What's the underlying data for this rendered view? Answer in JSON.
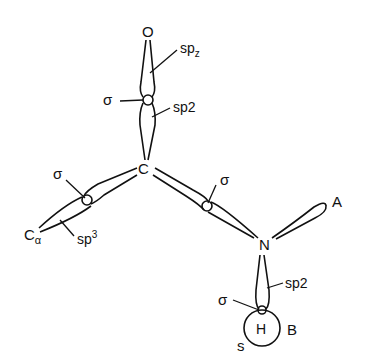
{
  "diagram": {
    "type": "orbital-bonding-diagram",
    "atoms": {
      "oxygen": "O",
      "carbon": "C",
      "c_alpha": "C",
      "c_alpha_sub": "α",
      "nitrogen": "N",
      "hydrogen": "H"
    },
    "labels": {
      "sp_z": "sp",
      "sp_z_sub": "z",
      "sp2_co": "sp2",
      "sigma_co": "σ",
      "sigma_cca": "σ",
      "sp3": "sp",
      "sp3_sup": "3",
      "sigma_cn": "σ",
      "lone_pair_A": "A",
      "sp2_nh": "sp2",
      "sigma_nh": "σ",
      "s_orbital": "s",
      "label_B": "B"
    }
  }
}
